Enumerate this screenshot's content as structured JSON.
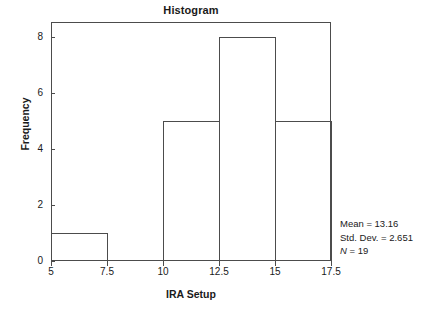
{
  "chart_data": {
    "type": "bar",
    "title": "Histogram",
    "xlabel": "IRA Setup",
    "ylabel": "Frequency",
    "categories": [
      "5 - 7.5",
      "7.5 - 10",
      "10 - 12.5",
      "12.5 - 15",
      "15 - 17.5"
    ],
    "bin_edges": [
      5,
      7.5,
      10,
      12.5,
      15,
      17.5
    ],
    "values": [
      1,
      0,
      5,
      8,
      5
    ],
    "xlim": [
      5,
      17.5
    ],
    "ylim": [
      0,
      8.54
    ],
    "x_ticks": [
      "5",
      "7.5",
      "10",
      "12.5",
      "15",
      "17.5"
    ],
    "x_tick_values": [
      5,
      7.5,
      10,
      12.5,
      15,
      17.5
    ],
    "y_ticks": [
      "0",
      "2",
      "4",
      "6",
      "8"
    ],
    "y_tick_values": [
      0,
      2,
      4,
      6,
      8
    ],
    "grid": false,
    "legend": false,
    "bar_fill": "none",
    "bar_outline_color": "#4c4c4c",
    "frame_color": "#4c4c4c",
    "background": "#ffffff",
    "annotations": [
      "Mean = 13.16",
      "Std. Dev. = 2.651",
      "N = 19"
    ]
  },
  "statistics": {
    "mean_line": "Mean = 13.16",
    "std_dev_line": "Std. Dev. = 2.651",
    "n_symbol": "N",
    "n_value": " = 19"
  }
}
